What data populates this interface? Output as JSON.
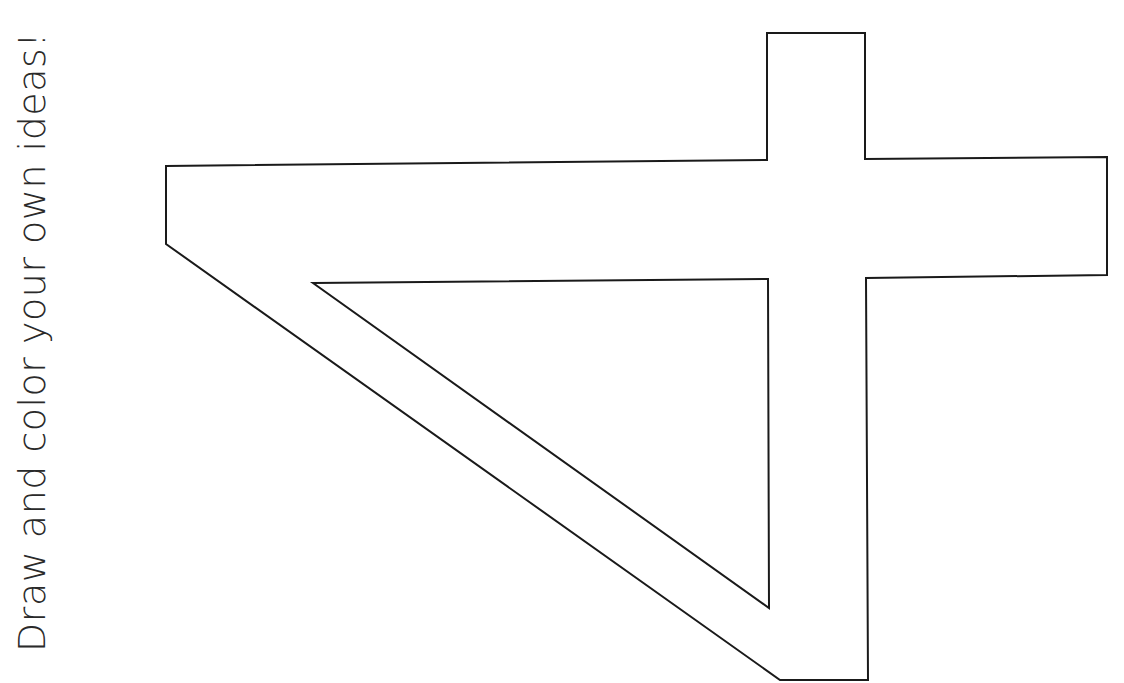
{
  "page": {
    "caption": "Draw and color your own ideas!",
    "numeral": "4",
    "orientation": "rotated 90 degrees counter-clockwise",
    "colors": {
      "background": "#ffffff",
      "outline": "#1a1a1a",
      "text": "#2a2a2a"
    }
  }
}
